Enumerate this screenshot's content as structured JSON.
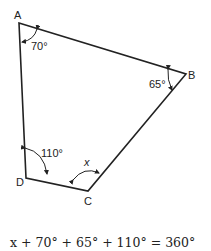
{
  "diagram": {
    "type": "quadrilateral",
    "vertices": [
      {
        "label": "A",
        "x": 19,
        "y": 23
      },
      {
        "label": "B",
        "x": 186,
        "y": 74
      },
      {
        "label": "C",
        "x": 88,
        "y": 191
      },
      {
        "label": "D",
        "x": 26,
        "y": 178
      }
    ],
    "angles": {
      "A": "70°",
      "B": "65°",
      "C": "x",
      "D": "110°"
    },
    "equation": "x + 70° + 65° + 110° = 360°",
    "stroke_color": "#222222"
  }
}
